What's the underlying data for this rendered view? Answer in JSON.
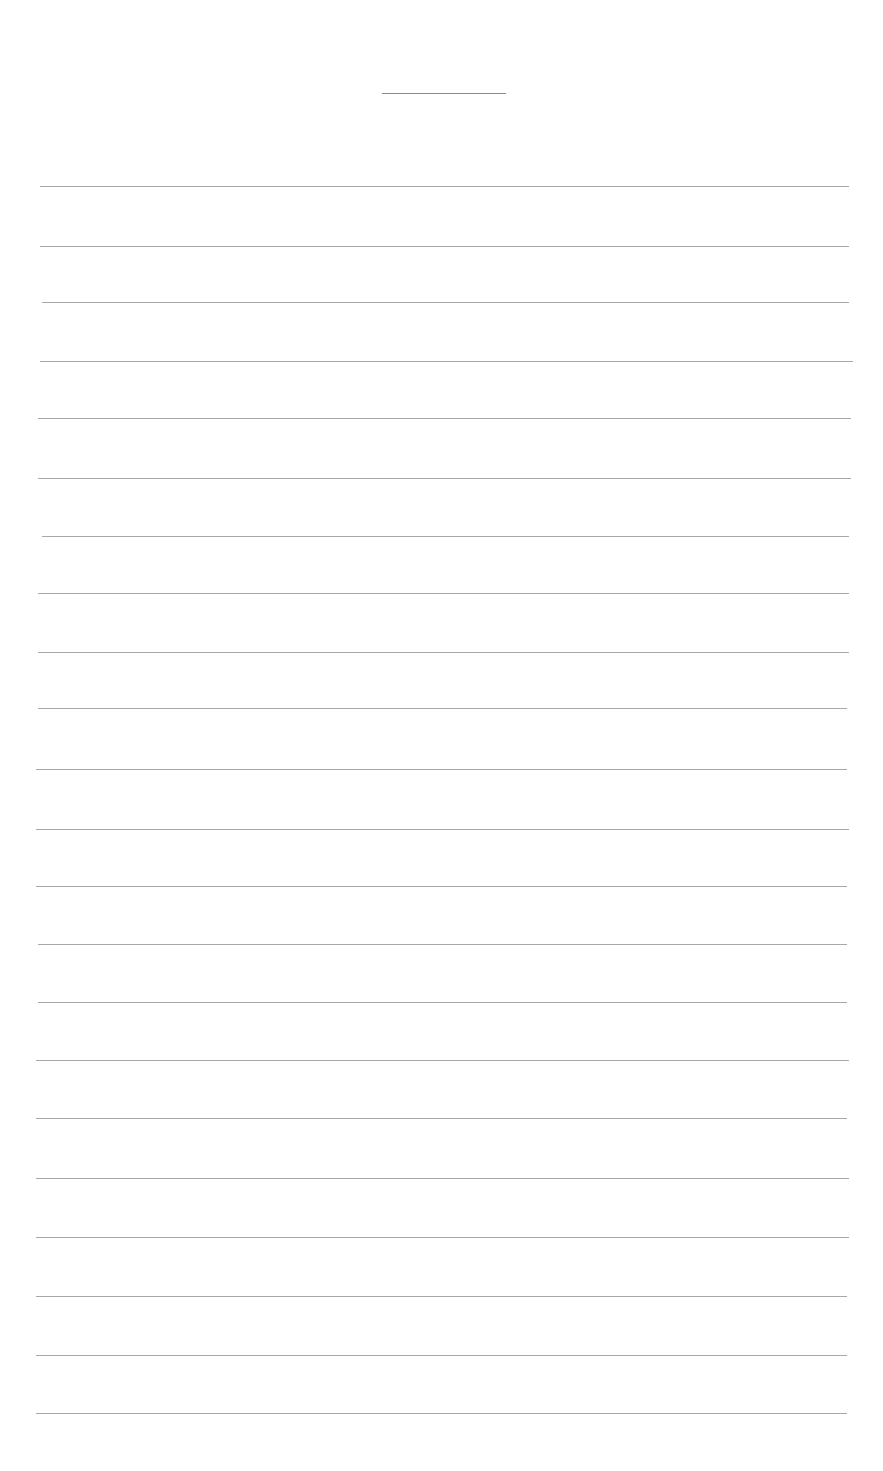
{
  "page": {
    "background": "#ffffff",
    "line_color": "#a8a8a8",
    "title_line": {
      "x": 382,
      "y": 93,
      "width": 124
    },
    "ruled_lines": [
      {
        "y": 186,
        "x1": 40,
        "x2": 849
      },
      {
        "y": 246,
        "x1": 40,
        "x2": 849
      },
      {
        "y": 302,
        "x1": 42,
        "x2": 849
      },
      {
        "y": 361,
        "x1": 40,
        "x2": 853
      },
      {
        "y": 418,
        "x1": 38,
        "x2": 851
      },
      {
        "y": 478,
        "x1": 38,
        "x2": 851
      },
      {
        "y": 536,
        "x1": 42,
        "x2": 849
      },
      {
        "y": 593,
        "x1": 38,
        "x2": 849
      },
      {
        "y": 652,
        "x1": 38,
        "x2": 849
      },
      {
        "y": 708,
        "x1": 38,
        "x2": 847
      },
      {
        "y": 769,
        "x1": 36,
        "x2": 847
      },
      {
        "y": 829,
        "x1": 36,
        "x2": 849
      },
      {
        "y": 886,
        "x1": 36,
        "x2": 847
      },
      {
        "y": 944,
        "x1": 38,
        "x2": 847
      },
      {
        "y": 1002,
        "x1": 38,
        "x2": 847
      },
      {
        "y": 1060,
        "x1": 36,
        "x2": 849
      },
      {
        "y": 1118,
        "x1": 36,
        "x2": 847
      },
      {
        "y": 1178,
        "x1": 36,
        "x2": 849
      },
      {
        "y": 1237,
        "x1": 36,
        "x2": 849
      },
      {
        "y": 1296,
        "x1": 36,
        "x2": 847
      },
      {
        "y": 1355,
        "x1": 36,
        "x2": 847
      },
      {
        "y": 1413,
        "x1": 36,
        "x2": 847
      }
    ]
  }
}
